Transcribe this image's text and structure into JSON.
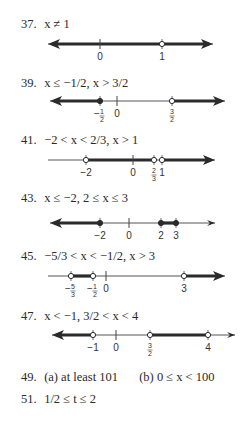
{
  "answers": [
    {
      "number": "37.",
      "text": "x ≠ 1",
      "line": {
        "y": 44,
        "x0": 48,
        "x1": 213,
        "left_arrow": true,
        "right_arrow": true,
        "thick": [
          [
            52,
            160
          ],
          [
            164,
            209
          ]
        ],
        "ticks": [
          {
            "x": 100,
            "label": "0"
          }
        ],
        "points": [
          {
            "x": 162,
            "label": "1",
            "filled": false
          }
        ]
      }
    },
    {
      "number": "39.",
      "text": "x ≤ −1/2, x > 3/2",
      "line": {
        "y": 101,
        "x0": 50,
        "x1": 225,
        "left_arrow": true,
        "right_arrow": true,
        "thick": [
          [
            54,
            100
          ],
          [
            172,
            221
          ]
        ],
        "ticks": [
          {
            "x": 117,
            "label": "0"
          }
        ],
        "points": [
          {
            "x": 100,
            "label": "−1/2",
            "filled": true
          },
          {
            "x": 172,
            "label": "3/2",
            "filled": false
          }
        ]
      }
    },
    {
      "number": "41.",
      "text": "−2 < x < 2/3, x > 1",
      "line": {
        "y": 160,
        "x0": 48,
        "x1": 215,
        "left_arrow": false,
        "right_arrow": true,
        "thick": [
          [
            86,
            154
          ],
          [
            162,
            211
          ]
        ],
        "ticks": [
          {
            "x": 133,
            "label": "0"
          }
        ],
        "points": [
          {
            "x": 86,
            "label": "−2",
            "filled": false
          },
          {
            "x": 154,
            "label": "2/3",
            "filled": false
          },
          {
            "x": 162,
            "label": "1",
            "filled": false
          }
        ]
      }
    },
    {
      "number": "43.",
      "text": "x ≤ −2, 2 ≤ x ≤ 3",
      "line": {
        "y": 223,
        "x0": 50,
        "x1": 215,
        "left_arrow": true,
        "right_arrow": true,
        "thin_right_arrow": true,
        "thick": [
          [
            54,
            100
          ],
          [
            161,
            176
          ]
        ],
        "ticks": [
          {
            "x": 129,
            "label": "0"
          }
        ],
        "points": [
          {
            "x": 100,
            "label": "−2",
            "filled": true
          },
          {
            "x": 161,
            "label": "2",
            "filled": true
          },
          {
            "x": 176,
            "label": "3",
            "filled": true
          }
        ]
      }
    },
    {
      "number": "45.",
      "text": "−5/3 < x < −1/2, x > 3",
      "line": {
        "y": 276,
        "x0": 48,
        "x1": 225,
        "left_arrow": false,
        "right_arrow": true,
        "thick": [
          [
            71,
            93
          ],
          [
            184,
            221
          ]
        ],
        "ticks": [
          {
            "x": 106,
            "label": "0"
          }
        ],
        "points": [
          {
            "x": 71,
            "label": "−5/3",
            "filled": false
          },
          {
            "x": 93,
            "label": "−1/2",
            "filled": false
          },
          {
            "x": 184,
            "label": "3",
            "filled": false
          }
        ]
      }
    },
    {
      "number": "47.",
      "text": "x < −1, 3/2 < x < 4",
      "line": {
        "y": 335,
        "x0": 52,
        "x1": 235,
        "left_arrow": true,
        "right_arrow": true,
        "thin_right_arrow": true,
        "thick": [
          [
            56,
            93
          ],
          [
            150,
            208
          ]
        ],
        "ticks": [
          {
            "x": 116,
            "label": "0"
          }
        ],
        "points": [
          {
            "x": 93,
            "label": "−1",
            "filled": false
          },
          {
            "x": 150,
            "label": "3/2",
            "filled": false
          },
          {
            "x": 208,
            "label": "4",
            "filled": false
          }
        ]
      }
    },
    {
      "number": "49.",
      "text_a": "(a)  at least 101",
      "text_b": "(b)  0 ≤ x < 100"
    },
    {
      "number": "51.",
      "text": "1/2 ≤ t ≤ 2"
    }
  ]
}
